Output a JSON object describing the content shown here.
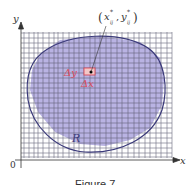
{
  "figure": {
    "caption": "Figure 7",
    "axes": {
      "x_label": "x",
      "y_label": "y",
      "origin_label": "0"
    },
    "region_label": "R",
    "point_label": "(x*ij , y*ij)",
    "point_label_parts": {
      "open": "(",
      "x": "x",
      "x_sup": "*",
      "x_sub": "ij",
      "comma": ",",
      "y": "y",
      "y_sup": "*",
      "y_sub": "ij",
      "close": ")"
    },
    "delta_y_label": "Δy",
    "delta_x_label": "Δx",
    "colors": {
      "region_fill": "#b9b3e3",
      "boundary": "#3b3a7a",
      "grid": "#5a5a6e",
      "delta_labels": "#d94a5a",
      "axis": "#333333"
    }
  }
}
